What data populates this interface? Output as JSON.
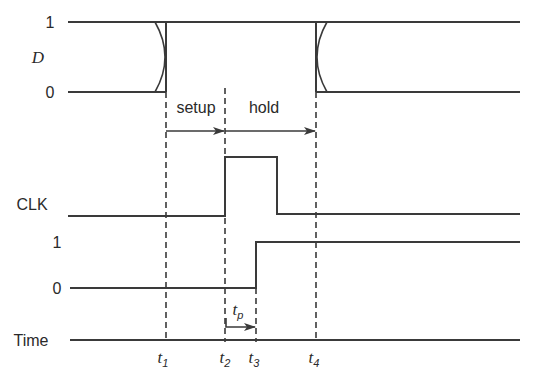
{
  "diagram": {
    "type": "timing-diagram",
    "signals": {
      "d": {
        "label": "D",
        "high_label": "1",
        "low_label": "0"
      },
      "clk": {
        "label": "CLK"
      },
      "q": {
        "high_label": "1",
        "low_label": "0"
      },
      "time": {
        "label": "Time"
      }
    },
    "markers": [
      {
        "id": "t1",
        "base": "t",
        "sub": "1"
      },
      {
        "id": "t2",
        "base": "t",
        "sub": "2"
      },
      {
        "id": "t3",
        "base": "t",
        "sub": "3"
      },
      {
        "id": "t4",
        "base": "t",
        "sub": "4"
      }
    ],
    "intervals": {
      "setup": "setup",
      "hold": "hold",
      "propagation": {
        "base": "t",
        "sub": "p"
      }
    },
    "colors": {
      "line": "#3a3a3a",
      "text": "#2a2a2a",
      "background": "#ffffff"
    }
  }
}
